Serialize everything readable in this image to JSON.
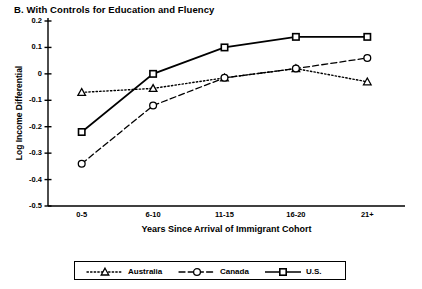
{
  "chart_data": {
    "type": "line",
    "title": "B.  With Controls for Education and Fluency",
    "xlabel": "Years Since Arrival of Immigrant Cohort",
    "ylabel": "Log Income Differential",
    "categories": [
      "0-5",
      "6-10",
      "11-15",
      "16-20",
      "21+"
    ],
    "ylim": [
      -0.5,
      0.2
    ],
    "yticks": [
      "0.2",
      "0.1",
      "0",
      "-0.1",
      "-0.2",
      "-0.3",
      "-0.4",
      "-0.5"
    ],
    "ytick_values": [
      0.2,
      0.1,
      0,
      -0.1,
      -0.2,
      -0.3,
      -0.4,
      -0.5
    ],
    "grid": false,
    "legend_position": "bottom",
    "series": [
      {
        "name": "Australia",
        "marker": "triangle",
        "line_style": "dotted",
        "values": [
          -0.07,
          -0.055,
          -0.015,
          0.02,
          -0.03
        ]
      },
      {
        "name": "Canada",
        "marker": "circle",
        "line_style": "dashed",
        "values": [
          -0.34,
          -0.12,
          -0.015,
          0.02,
          0.06
        ]
      },
      {
        "name": "U.S.",
        "marker": "square",
        "line_style": "solid",
        "values": [
          -0.22,
          0.0,
          0.1,
          0.14,
          0.14
        ]
      }
    ],
    "colors": {
      "axis": "#000000",
      "series": [
        "#000000",
        "#000000",
        "#000000"
      ]
    }
  }
}
